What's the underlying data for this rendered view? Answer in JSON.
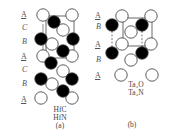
{
  "panel_a": {
    "layer_labels": [
      {
        "text": "A",
        "x": 21,
        "y": 11
      },
      {
        "text": "C",
        "x": 22,
        "y": 23
      },
      {
        "text": "B",
        "x": 22,
        "y": 38
      },
      {
        "text": "A",
        "x": 21,
        "y": 53
      },
      {
        "text": "C",
        "x": 22,
        "y": 66
      },
      {
        "text": "B",
        "x": 22,
        "y": 79
      },
      {
        "text": "A",
        "x": 21,
        "y": 96
      }
    ],
    "compound_1": "HfC",
    "compound_2": "HfN",
    "caption": "(a)"
  },
  "panel_b": {
    "layer_labels": [
      {
        "text": "A",
        "x": 95,
        "y": 12
      },
      {
        "text": "B",
        "x": 96,
        "y": 23
      },
      {
        "text": "A",
        "x": 95,
        "y": 41
      },
      {
        "text": "B",
        "x": 96,
        "y": 56
      },
      {
        "text": "A",
        "x": 95,
        "y": 72
      }
    ],
    "compound_1": "Ta₂O",
    "compound_2": "Ta₂N",
    "caption": "(b)"
  },
  "colors": {
    "open_atom_stroke": "#333333",
    "filled_atom": "#000000",
    "cell_line": "#444444"
  }
}
